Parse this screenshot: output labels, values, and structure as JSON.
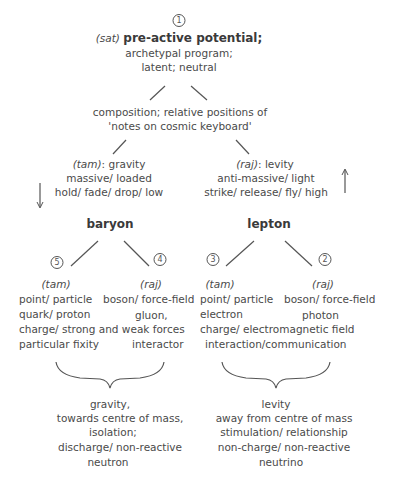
{
  "top_cutoff_text": "",
  "root": {
    "number": "1",
    "prefix": "(sat)",
    "title": "pre-active potential;",
    "lines": [
      "archetypal program;",
      "latent; neutral"
    ]
  },
  "composition": {
    "lines": [
      "composition; relative positions of",
      "'notes on cosmic keyboard'"
    ]
  },
  "left_branch": {
    "prefix": "(tam)",
    "label": ": gravity",
    "lines": [
      "massive/ loaded",
      "hold/ fade/ drop/ low"
    ],
    "arrow": "down-arrow",
    "node": "baryon",
    "children": [
      {
        "number": "5",
        "prefix": "(tam)",
        "lines": [
          "point/ particle",
          "quark/ proton"
        ]
      },
      {
        "number": "4",
        "prefix": "(raj)",
        "lines": [
          "boson/ force-field",
          "gluon,"
        ]
      }
    ],
    "shared_lines": [
      "charge/ strong and weak forces"
    ],
    "bottom_left": "particular fixity",
    "bottom_right": "interactor",
    "summary": [
      "gravity,",
      "towards centre of mass,",
      "isolation;",
      "discharge/ non-reactive",
      "neutron"
    ]
  },
  "right_branch": {
    "prefix": "(raj)",
    "label": ": levity",
    "lines": [
      "anti-massive/ light",
      "strike/ release/ fly/ high"
    ],
    "arrow": "up-arrow",
    "node": "lepton",
    "children": [
      {
        "number": "3",
        "prefix": "(tam)",
        "lines": [
          "point/ particle",
          "electron"
        ]
      },
      {
        "number": "2",
        "prefix": "(raj)",
        "lines": [
          "boson/ force-field",
          "photon"
        ]
      }
    ],
    "shared_lines": [
      "charge/ electromagnetic field",
      "interaction/communication"
    ],
    "summary": [
      "levity",
      "away from centre of mass",
      "stimulation/ relationship",
      "non-charge/ non-reactive",
      "neutrino"
    ]
  }
}
